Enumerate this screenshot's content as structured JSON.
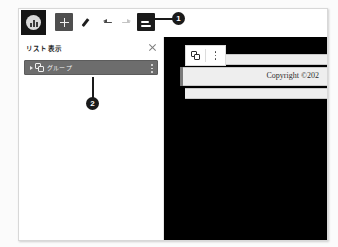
{
  "app": {
    "icon": "app-logo-icon"
  },
  "toolbar": {
    "add_label": "add-icon",
    "edit_label": "pencil-icon",
    "undo_label": "undo-icon",
    "redo_label": "redo-icon",
    "list_view_label": "list-view-icon"
  },
  "list_panel": {
    "title": "リスト表示",
    "close_label": "×",
    "rows": [
      {
        "label": "グループ",
        "icon": "group-icon",
        "menu": "more-vertical-icon",
        "selected": true
      }
    ]
  },
  "canvas": {
    "float_toolbar": {
      "copy_label": "copy-group-icon",
      "menu_label": "more-vertical-icon"
    },
    "copyright_text": "Copyright ©202"
  },
  "annotations": [
    {
      "number": "1"
    },
    {
      "number": "2"
    }
  ],
  "colors": {
    "frame_border": "#d8d8d8",
    "toolbar_bg": "#ffffff",
    "app_badge_bg": "#151515",
    "active_button_bg": "#1b1b1b",
    "row_selected_bg": "#6d6d6d",
    "canvas_bg": "#000000",
    "page_band_bg": "#eeeeee",
    "callout_bg": "#1a1a1a"
  }
}
